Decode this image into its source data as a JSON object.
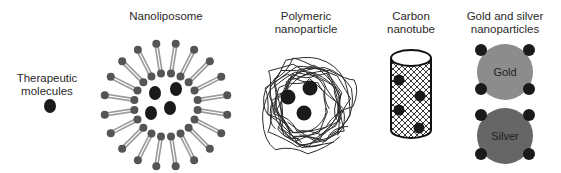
{
  "diagram": {
    "items": [
      {
        "id": "therapeutic",
        "label_lines": [
          "Therapeutic",
          "molecules"
        ]
      },
      {
        "id": "nanoliposome",
        "label_lines": [
          "Nanoliposome"
        ]
      },
      {
        "id": "polymeric",
        "label_lines": [
          "Polymeric",
          "nanoparticle"
        ]
      },
      {
        "id": "nanotube",
        "label_lines": [
          "Carbon",
          "nanotube"
        ]
      },
      {
        "id": "metal",
        "label_lines": [
          "Gold and silver",
          "nanoparticles"
        ]
      }
    ],
    "gold_label": "Gold",
    "silver_label": "Silver",
    "liposome_lipid_count": 20,
    "colors": {
      "drug": "#1a1a1a",
      "lipid_head": "#555555",
      "lipid_tail": "#9a9a9a",
      "polymer": "#2b2b2b",
      "gold": "#8c8c8c",
      "silver": "#666666"
    }
  }
}
